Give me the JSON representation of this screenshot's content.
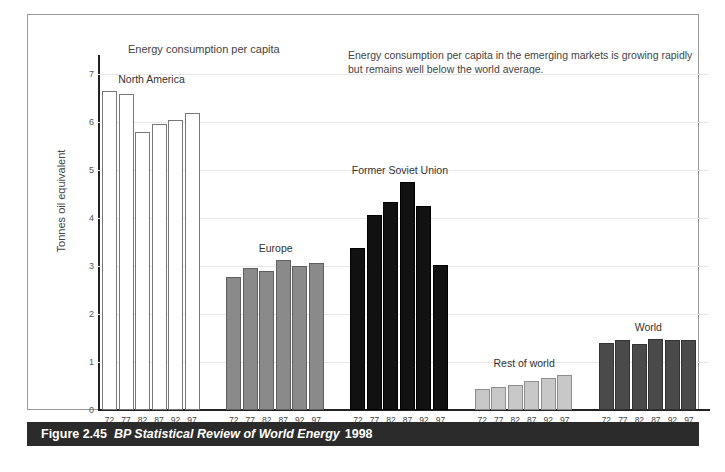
{
  "chart_data": {
    "type": "bar",
    "title": "Energy consumption per capita",
    "xlabel": "Year",
    "ylabel": "Tonnes oil equivalent",
    "ylim": [
      0,
      7.4
    ],
    "yticks": [
      0,
      1,
      2,
      3,
      4,
      5,
      6,
      7
    ],
    "ytick_labels": [
      "0",
      "1",
      "2",
      "3",
      "4",
      "5",
      "6",
      "7"
    ],
    "grid": true,
    "legend_position": "none",
    "categories": [
      "72",
      "77",
      "82",
      "87",
      "92",
      "97"
    ],
    "annotation": "Energy consumption per capita in the emerging markets is growing rapidly but remains well below the world average.",
    "groups": [
      {
        "name": "North America",
        "color": "#ffffff",
        "border": "#777777",
        "values": [
          6.65,
          6.58,
          5.8,
          5.97,
          6.05,
          6.2
        ],
        "categories": [
          "72",
          "77",
          "82",
          "87",
          "92",
          "97"
        ]
      },
      {
        "name": "Europe",
        "color": "#8a8a8a",
        "border": "#5f5f5f",
        "values": [
          2.77,
          2.97,
          2.9,
          3.13,
          3.0,
          3.07
        ],
        "categories": [
          "72",
          "77",
          "82",
          "87",
          "92",
          "97"
        ]
      },
      {
        "name": "Former Soviet Union",
        "color": "#111111",
        "border": "#000000",
        "values": [
          3.37,
          4.07,
          4.33,
          4.75,
          4.25,
          3.02
        ],
        "categories": [
          "72",
          "77",
          "82",
          "87",
          "92",
          "97"
        ]
      },
      {
        "name": "Rest of world",
        "color": "#c8c8c8",
        "border": "#8d8d8d",
        "values": [
          0.43,
          0.48,
          0.53,
          0.6,
          0.67,
          0.73
        ],
        "categories": [
          "72",
          "77",
          "82",
          "87",
          "92",
          "97"
        ]
      },
      {
        "name": "World",
        "color": "#4a4a4a",
        "border": "#333333",
        "values": [
          1.4,
          1.45,
          1.37,
          1.47,
          1.45,
          1.45
        ],
        "categories": [
          "72",
          "77",
          "82",
          "87",
          "92",
          "97"
        ]
      }
    ]
  },
  "caption": {
    "figure_number": "Figure 2.45",
    "source": "BP Statistical Review of World Energy",
    "year": "1998"
  }
}
